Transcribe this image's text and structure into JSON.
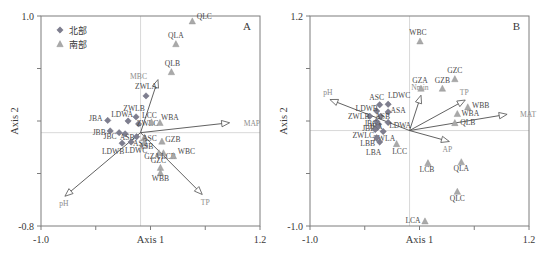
{
  "figure": {
    "type": "ordination-biplot-pair",
    "legend": {
      "items": [
        {
          "label": "北部",
          "marker": "diamond",
          "color": "#7e7e8f"
        },
        {
          "label": "南部",
          "marker": "triangle",
          "color": "#a9a9a9"
        }
      ]
    }
  },
  "chart_data": [
    {
      "type": "scatter",
      "panel": "A",
      "title": "A",
      "xlabel": "Axis 1",
      "ylabel": "Axis 2",
      "xlim": [
        -1.0,
        1.2
      ],
      "ylim": [
        -0.8,
        1.0
      ],
      "xticks": [
        -1.0,
        -0.45,
        0.1,
        0.65,
        1.2
      ],
      "xticklabels": [
        "-1.0",
        "",
        "Axis 1",
        "",
        "1.2"
      ],
      "yticks": [
        -0.8,
        -0.35,
        0.1,
        0.55,
        1.0
      ],
      "yticklabels": [
        "-0.8",
        "",
        "",
        "",
        "1.0"
      ],
      "grid": true,
      "legend_position": "top-left",
      "series": [
        {
          "name": "北部",
          "marker": "diamond",
          "color": "#7e7e8f",
          "points": [
            {
              "label": "ZWLA",
              "x": 0.055,
              "y": 0.315
            },
            {
              "label": "ZWLB",
              "x": -0.045,
              "y": 0.135
            },
            {
              "label": "LDWA",
              "x": -0.125,
              "y": 0.1
            },
            {
              "label": "JBA",
              "x": -0.33,
              "y": 0.105
            },
            {
              "label": "ZWLC",
              "x": -0.02,
              "y": 0.075
            },
            {
              "label": "JBB",
              "x": -0.305,
              "y": 0.015
            },
            {
              "label": "JBC",
              "x": -0.215,
              "y": 0.0
            },
            {
              "label": "ASB",
              "x": -0.155,
              "y": -0.01
            },
            {
              "label": "LDWB",
              "x": -0.185,
              "y": -0.09
            },
            {
              "label": "LDWC",
              "x": -0.095,
              "y": -0.08
            },
            {
              "label": "ASA",
              "x": -0.04,
              "y": -0.035
            }
          ]
        },
        {
          "name": "南部",
          "marker": "triangle",
          "color": "#a9a9a9",
          "points": [
            {
              "label": "QLC",
              "x": 0.52,
              "y": 0.955
            },
            {
              "label": "QLA",
              "x": 0.355,
              "y": 0.76
            },
            {
              "label": "QLB",
              "x": 0.31,
              "y": 0.52
            },
            {
              "label": "LCC",
              "x": 0.11,
              "y": 0.09
            },
            {
              "label": "WBA",
              "x": 0.195,
              "y": 0.085
            },
            {
              "label": "ASC",
              "x": 0.04,
              "y": -0.04
            },
            {
              "label": "GZB",
              "x": 0.215,
              "y": -0.075
            },
            {
              "label": "ASB",
              "x": 0.035,
              "y": -0.09
            },
            {
              "label": "GZA",
              "x": 0.185,
              "y": -0.175
            },
            {
              "label": "LCB",
              "x": 0.23,
              "y": -0.175
            },
            {
              "label": "WBC",
              "x": 0.33,
              "y": -0.2
            },
            {
              "label": "GZC",
              "x": 0.2,
              "y": -0.3
            },
            {
              "label": "WBB",
              "x": 0.2,
              "y": -0.345
            }
          ]
        }
      ],
      "arrows": [
        {
          "label": "MAP",
          "x": 0.895,
          "y": 0.085
        },
        {
          "label": "TP",
          "x": 0.62,
          "y": -0.53
        },
        {
          "label": "pH",
          "x": -0.76,
          "y": -0.545
        },
        {
          "label": "MBC",
          "x": 0.175,
          "y": 0.455
        }
      ]
    },
    {
      "type": "scatter",
      "panel": "B",
      "title": "B",
      "xlabel": "Axis 1",
      "ylabel": "Axis 2",
      "xlim": [
        -1.0,
        1.2
      ],
      "ylim": [
        -1.0,
        1.2
      ],
      "xticks": [
        -1.0,
        -0.45,
        0.1,
        0.65,
        1.2
      ],
      "xticklabels": [
        "-1.0",
        "",
        "Axis 1",
        "",
        "1.2"
      ],
      "yticks": [
        -1.0,
        -0.45,
        0.1,
        0.65,
        1.2
      ],
      "yticklabels": [
        "-1.0",
        "",
        "",
        "",
        "1.2"
      ],
      "grid": true,
      "legend_position": "none",
      "series": [
        {
          "name": "北部",
          "marker": "diamond",
          "color": "#7e7e8f",
          "points": [
            {
              "label": "ASC",
              "x": -0.3,
              "y": 0.27
            },
            {
              "label": "LDWC",
              "x": -0.215,
              "y": 0.275
            },
            {
              "label": "LDWB",
              "x": -0.33,
              "y": 0.205
            },
            {
              "label": "ASA",
              "x": -0.215,
              "y": 0.195
            },
            {
              "label": "ZWLB",
              "x": -0.4,
              "y": 0.15
            },
            {
              "label": "ASB",
              "x": -0.29,
              "y": 0.15
            },
            {
              "label": "JBC",
              "x": -0.33,
              "y": 0.095
            },
            {
              "label": "LDWA",
              "x": -0.215,
              "y": 0.085
            },
            {
              "label": "JBA",
              "x": -0.31,
              "y": 0.065
            },
            {
              "label": "JBB",
              "x": -0.32,
              "y": 0.035
            },
            {
              "label": "ZWLC",
              "x": -0.345,
              "y": 0.01
            },
            {
              "label": "ZWLA",
              "x": -0.265,
              "y": -0.01
            },
            {
              "label": "LBB",
              "x": -0.33,
              "y": -0.075
            },
            {
              "label": "LBA",
              "x": -0.3,
              "y": -0.12
            }
          ]
        },
        {
          "name": "南部",
          "marker": "triangle",
          "color": "#a9a9a9",
          "points": [
            {
              "label": "WBC",
              "x": 0.105,
              "y": 0.935
            },
            {
              "label": "GZC",
              "x": 0.455,
              "y": 0.54
            },
            {
              "label": "GZB",
              "x": 0.33,
              "y": 0.44
            },
            {
              "label": "GZA",
              "x": 0.115,
              "y": 0.44
            },
            {
              "label": "WBB",
              "x": 0.585,
              "y": 0.245
            },
            {
              "label": "WBA",
              "x": 0.48,
              "y": 0.175
            },
            {
              "label": "QLB",
              "x": 0.455,
              "y": 0.08
            },
            {
              "label": "LCC",
              "x": -0.13,
              "y": -0.14
            },
            {
              "label": "LCB",
              "x": 0.185,
              "y": -0.34
            },
            {
              "label": "QLA",
              "x": 0.52,
              "y": -0.33
            },
            {
              "label": "QLC",
              "x": 0.48,
              "y": -0.64
            },
            {
              "label": "LCA",
              "x": 0.155,
              "y": -0.95
            }
          ]
        }
      ],
      "arrows": [
        {
          "label": "MAT",
          "x": 0.98,
          "y": 0.17
        },
        {
          "label": "TP",
          "x": 0.56,
          "y": 0.32
        },
        {
          "label": "AP",
          "x": 0.4,
          "y": -0.115
        },
        {
          "label": "pH",
          "x": -0.8,
          "y": 0.325
        },
        {
          "label": "Nmin",
          "x": 0.115,
          "y": 0.37
        }
      ]
    }
  ]
}
